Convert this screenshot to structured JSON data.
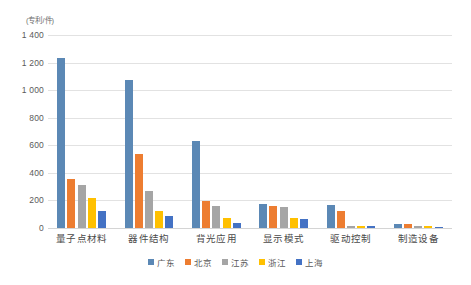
{
  "chart_data": {
    "type": "bar",
    "title": "",
    "subtitle": "",
    "xlabel": "",
    "ylabel": "",
    "unit_label": "(专利/件)",
    "categories": [
      "量子点材料",
      "器件结构",
      "背光应用",
      "显示模式",
      "驱动控制",
      "制造设备"
    ],
    "series": [
      {
        "name": "广东",
        "color": "#5B88B5",
        "values": [
          1230,
          1075,
          630,
          175,
          170,
          30
        ]
      },
      {
        "name": "北京",
        "color": "#ED7D31",
        "values": [
          355,
          535,
          195,
          160,
          120,
          28
        ]
      },
      {
        "name": "江苏",
        "color": "#A5A5A5",
        "values": [
          315,
          265,
          160,
          150,
          18,
          15
        ]
      },
      {
        "name": "浙江",
        "color": "#FFC000",
        "values": [
          215,
          120,
          75,
          70,
          15,
          12
        ]
      },
      {
        "name": "上海",
        "color": "#4472C4",
        "values": [
          120,
          90,
          35,
          62,
          12,
          10
        ]
      }
    ],
    "yticks": [
      "0",
      "200",
      "400",
      "600",
      "800",
      "1 000",
      "1 200",
      "1 400"
    ],
    "ytick_values": [
      0,
      200,
      400,
      600,
      800,
      1000,
      1200,
      1400
    ],
    "ylim": [
      0,
      1400
    ],
    "grid": true,
    "legend_position": "bottom"
  },
  "legend": {
    "items": [
      {
        "label": "广东",
        "color": "#5B88B5"
      },
      {
        "label": "北京",
        "color": "#ED7D31"
      },
      {
        "label": "江苏",
        "color": "#A5A5A5"
      },
      {
        "label": "浙江",
        "color": "#FFC000"
      },
      {
        "label": "上海",
        "color": "#4472C4"
      }
    ]
  }
}
